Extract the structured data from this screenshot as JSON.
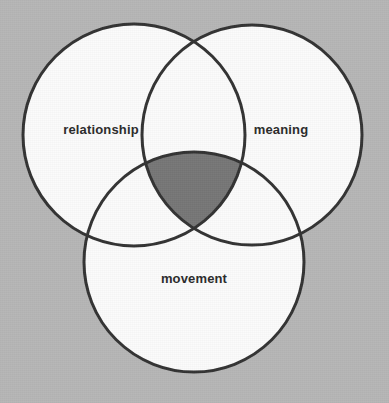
{
  "diagram": {
    "type": "venn",
    "set_count": 3,
    "title": "",
    "background_color": "#b6b6b6",
    "circle_fill_color": "#fbfbfb",
    "circle_stroke_color": "#333333",
    "circle_stroke_width": 3,
    "highlight_fill_color": "#777777",
    "label_color": "#2b2b2b",
    "sets": [
      {
        "id": "relationship",
        "label": "relationship",
        "cx": 134,
        "cy": 135,
        "r": 111,
        "label_x": 101,
        "label_y": 129
      },
      {
        "id": "meaning",
        "label": "meaning",
        "cx": 252,
        "cy": 135,
        "r": 110,
        "label_x": 281,
        "label_y": 129
      },
      {
        "id": "movement",
        "label": "movement",
        "cx": 194,
        "cy": 262,
        "r": 110,
        "label_x": 194,
        "label_y": 278
      }
    ],
    "highlighted_region": {
      "id": "relationship-meaning-movement",
      "label": "",
      "members": [
        "relationship",
        "meaning",
        "movement"
      ],
      "shaded": true,
      "fill_color": "#777777"
    }
  }
}
